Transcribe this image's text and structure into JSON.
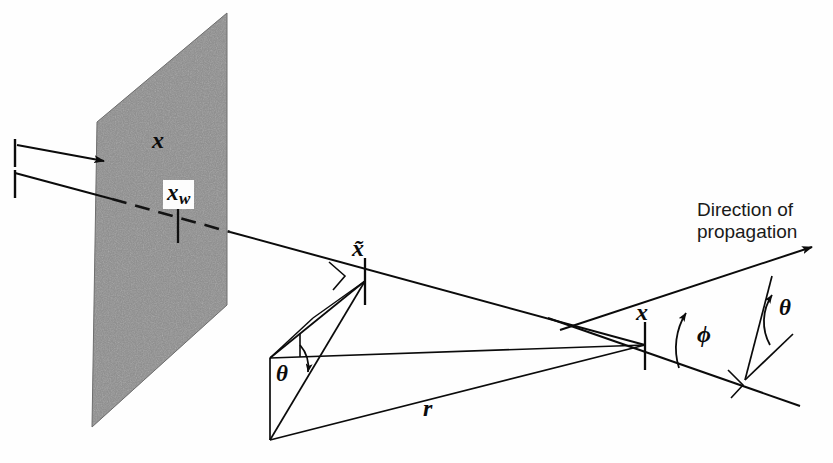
{
  "figure": {
    "kind": "technical-line-diagram",
    "background_color": "#fefefe",
    "ink_color": "#0b0b0b"
  },
  "surface": {
    "name": "stippled-plane",
    "description": "Textured (stippled) parallelogram representing a wall surface",
    "fill_color": "#8d8d8d",
    "corners": [
      [
        97,
        122
      ],
      [
        227,
        13
      ],
      [
        227,
        305
      ],
      [
        92,
        427
      ]
    ]
  },
  "labels": {
    "x_axis": "x",
    "x_wall": "x",
    "x_wall_subscript": "w",
    "x_tilde": "x̃",
    "x_center": "x",
    "r": "r",
    "theta_left": "θ",
    "theta_right": "θ",
    "phi": "ϕ",
    "direction_line1": "Direction of",
    "direction_line2": "propagation"
  },
  "geometry": {
    "x_tick_upper": {
      "x": 15,
      "y1": 140,
      "y2": 168
    },
    "x_tick_lower": {
      "x": 15,
      "y1": 168,
      "y2": 196
    },
    "x_arrow": {
      "x1": 38,
      "y1": 146,
      "x2": 112,
      "y2": 160
    },
    "ray_main": {
      "x1": 15,
      "y1": 172,
      "x2": 645,
      "y2": 345
    },
    "x_wall_point": [
      178,
      216
    ],
    "x_tilde_point": [
      365,
      280
    ],
    "x_center_point": [
      645,
      345
    ],
    "left_vertex": [
      270,
      358
    ],
    "bottom_vertex": [
      270,
      440
    ],
    "propagation_arrow_tip": [
      818,
      243
    ],
    "phi_arc_center": [
      645,
      345
    ],
    "theta_right_vertex": [
      745,
      380
    ]
  },
  "annotations": {
    "right_angle_markers": 3,
    "angle_arcs": 3,
    "tick_marks": 5
  }
}
